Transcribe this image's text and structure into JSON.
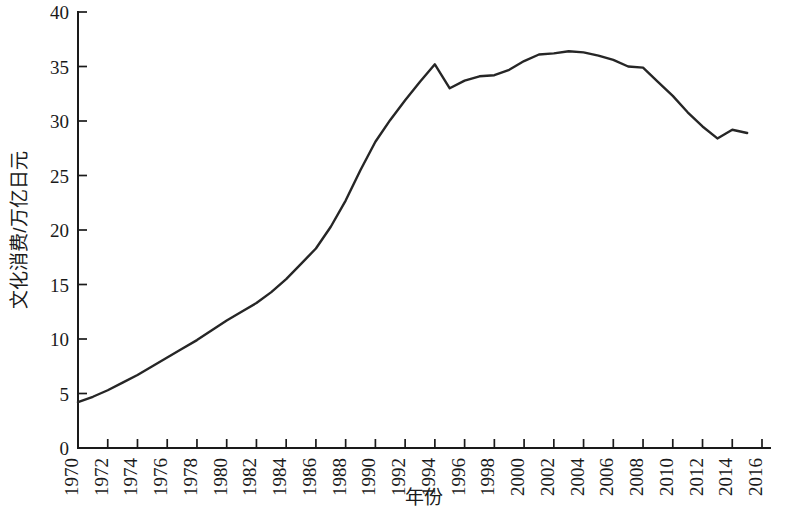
{
  "chart_data": {
    "type": "line",
    "title": "",
    "xlabel": "年份",
    "ylabel": "文化消费/万亿日元",
    "xlim": [
      1970,
      2016
    ],
    "ylim": [
      0,
      40
    ],
    "grid": false,
    "legend": null,
    "line_color": "#262626",
    "x_tick_labels": [
      "1970",
      "1972",
      "1974",
      "1976",
      "1978",
      "1980",
      "1982",
      "1984",
      "1986",
      "1988",
      "1990",
      "1992",
      "1994",
      "1996",
      "1998",
      "2000",
      "2002",
      "2004",
      "2006",
      "2008",
      "2010",
      "2012",
      "2014",
      "2016"
    ],
    "y_tick_labels": [
      "0",
      "5",
      "10",
      "15",
      "20",
      "25",
      "30",
      "35",
      "40"
    ],
    "x": [
      1970,
      1971,
      1972,
      1973,
      1974,
      1975,
      1976,
      1977,
      1978,
      1979,
      1980,
      1981,
      1982,
      1983,
      1984,
      1985,
      1986,
      1987,
      1988,
      1989,
      1990,
      1991,
      1992,
      1993,
      1994,
      1995,
      1996,
      1997,
      1998,
      1999,
      2000,
      2001,
      2002,
      2003,
      2004,
      2005,
      2006,
      2007,
      2008,
      2009,
      2010,
      2011,
      2012,
      2013,
      2014,
      2015
    ],
    "values": [
      4.2,
      4.7,
      5.3,
      6.0,
      6.7,
      7.5,
      8.3,
      9.1,
      9.9,
      10.8,
      11.7,
      12.5,
      13.3,
      14.3,
      15.5,
      16.9,
      18.3,
      20.3,
      22.7,
      25.5,
      28.1,
      30.1,
      31.9,
      33.6,
      35.2,
      33.0,
      33.7,
      34.1,
      34.2,
      34.7,
      35.5,
      36.1,
      36.2,
      36.4,
      36.3,
      36.0,
      35.6,
      35.0,
      34.9,
      33.6,
      32.3,
      30.8,
      29.5,
      28.4,
      29.2,
      28.9
    ]
  }
}
